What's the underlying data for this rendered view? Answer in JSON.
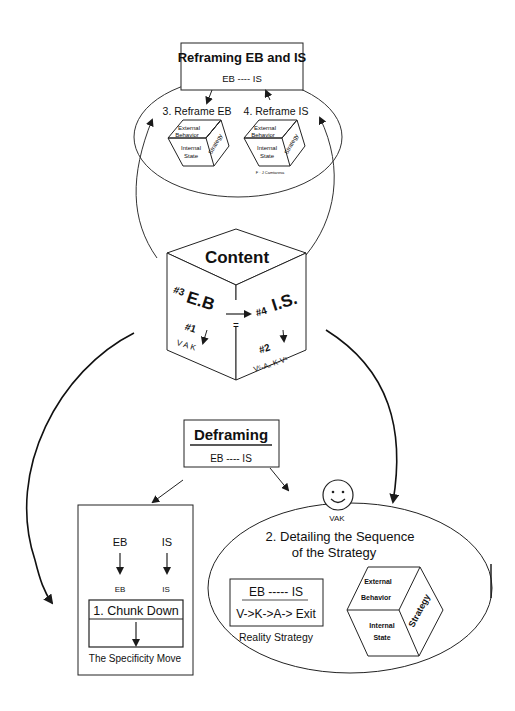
{
  "reframing": {
    "title": "Reframing EB and IS",
    "subtitle": "EB ---- IS",
    "step3_label": "3. Reframe EB",
    "step4_label": "4. Reframe IS",
    "cube_left": {
      "top": [
        "External",
        "Behavior"
      ],
      "bottom": [
        "Internal",
        "State"
      ],
      "side": "Strategy"
    },
    "cube_right": {
      "top": [
        "External",
        "Behavior"
      ],
      "bottom": [
        "Internal",
        "State"
      ],
      "side": "Strategy"
    },
    "caption": "F · J Camtaresa"
  },
  "content_cube": {
    "title": "Content",
    "left_face": {
      "heading_num": "#3",
      "heading": "E.B",
      "sub_num": "#1",
      "sub": "V A K"
    },
    "right_face": {
      "heading_num": "#4",
      "heading": "I.S.",
      "sub_num": "#2",
      "sub": "Vᶜ-Aₓ-K-Vᶜ"
    },
    "equals": "="
  },
  "deframing": {
    "title": "Deframing",
    "subtitle": "EB ---- IS"
  },
  "chunk_down": {
    "col1_top": "EB",
    "col2_top": "IS",
    "col1_bottom": "EB",
    "col2_bottom": "IS",
    "box_label": "1. Chunk Down",
    "caption": "The Specificity Move"
  },
  "detailing": {
    "smiley_label": "VAK",
    "title_line1": "2. Detailing the Sequence",
    "title_line2": "of the Strategy",
    "reality_box": {
      "line1": "EB ----- IS",
      "line2": "V->K->A-> Exit"
    },
    "reality_caption": "Reality Strategy",
    "cube": {
      "top": [
        "External",
        "Behavior"
      ],
      "bottom": [
        "Internal",
        "State"
      ],
      "side": "Strategy"
    }
  },
  "colors": {
    "line": "#1a1a1a",
    "background": "#ffffff"
  }
}
